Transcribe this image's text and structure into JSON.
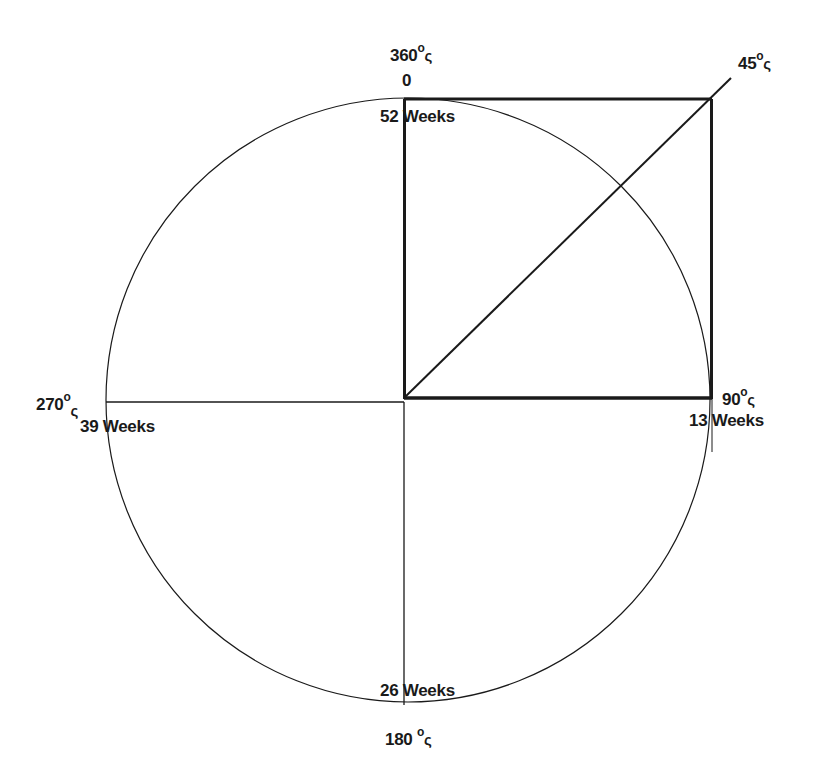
{
  "diagram": {
    "type": "circle-time-angle",
    "colors": {
      "line": "#1a1a1a",
      "background": "#ffffff"
    },
    "labels": {
      "top_angle": "360",
      "top_zero": "0",
      "top_weeks": "52 Weeks",
      "diag_angle": "45",
      "right_angle": "90",
      "right_weeks": "13 Weeks",
      "left_angle": "270",
      "left_weeks": "39 Weeks",
      "bottom_weeks": "26 Weeks",
      "bottom_angle": "180",
      "degree_symbol": "o",
      "angle_mark": "ς"
    },
    "markers": [
      {
        "angle": "360°",
        "weeks": "52 Weeks",
        "extra": "0",
        "position": "top"
      },
      {
        "angle": "45°",
        "position": "upper-right diagonal"
      },
      {
        "angle": "90°",
        "weeks": "13 Weeks",
        "position": "right"
      },
      {
        "angle": "180°",
        "weeks": "26 Weeks",
        "position": "bottom"
      },
      {
        "angle": "270°",
        "weeks": "39 Weeks",
        "position": "left"
      }
    ]
  }
}
